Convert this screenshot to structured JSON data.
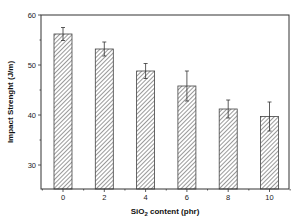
{
  "chart_data": {
    "type": "bar",
    "title": "",
    "xlabel": "SiO2 content (phr)",
    "xlabel_parts": {
      "pre": "SiO",
      "sub": "2",
      "post": " content (phr)"
    },
    "ylabel": "Impact Strenght (J/m)",
    "categories": [
      "0",
      "2",
      "4",
      "6",
      "8",
      "10"
    ],
    "values": [
      56.2,
      53.2,
      48.8,
      45.8,
      41.2,
      39.7
    ],
    "error": [
      1.3,
      1.4,
      1.5,
      3.0,
      1.8,
      2.9
    ],
    "ylim": [
      25.2,
      60
    ],
    "yticks": [
      30,
      40,
      50,
      60
    ],
    "yticks_minor": [
      35,
      45,
      55
    ],
    "grid": false,
    "legend": null,
    "bar_fill": "diagonal-hatch",
    "colors": {
      "hatch": "#555555",
      "axis": "#333333",
      "bar_edge": "#444444"
    }
  }
}
